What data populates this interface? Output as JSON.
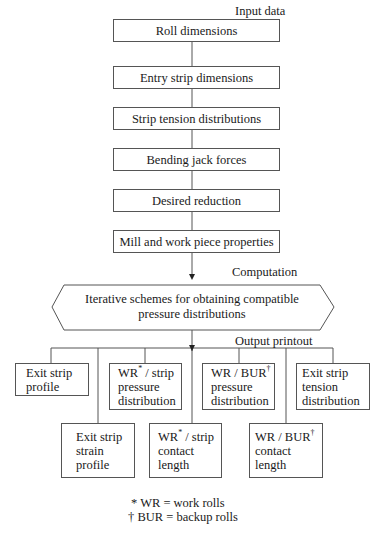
{
  "section_labels": {
    "input": "Input data",
    "computation": "Computation",
    "output": "Output printout"
  },
  "input_boxes": [
    "Roll dimensions",
    "Entry strip dimensions",
    "Strip tension distributions",
    "Bending jack forces",
    "Desired reduction",
    "Mill and work piece properties"
  ],
  "computation_box": {
    "line1": "Iterative schemes for obtaining compatible",
    "line2": "pressure distributions"
  },
  "output_boxes": {
    "exit_profile": {
      "lines": [
        "Exit strip",
        "profile"
      ]
    },
    "wr_strip_pressure": {
      "prefix": "WR",
      "mark": "*",
      "suffix": " / strip",
      "lines": [
        "pressure",
        "distribution"
      ]
    },
    "wr_bur_pressure": {
      "prefix": "WR / BUR",
      "mark": "†",
      "lines": [
        "pressure",
        "distribution"
      ]
    },
    "exit_tension": {
      "lines": [
        "Exit strip",
        "tension",
        "distribution"
      ]
    },
    "exit_strain": {
      "lines": [
        "Exit strip",
        "strain",
        "profile"
      ]
    },
    "wr_strip_contact": {
      "prefix": "WR",
      "mark": "*",
      "suffix": " / strip",
      "lines": [
        "contact",
        "length"
      ]
    },
    "wr_bur_contact": {
      "prefix": "WR / BUR",
      "mark": "†",
      "lines": [
        "contact",
        "length"
      ]
    }
  },
  "footnotes": [
    "* WR = work rolls",
    "† BUR =  backup rolls"
  ]
}
